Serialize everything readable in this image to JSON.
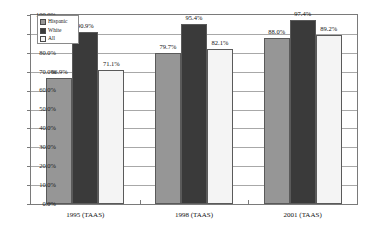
{
  "chart_data": {
    "type": "bar",
    "title": "",
    "xlabel": "",
    "ylabel": "",
    "categories": [
      "1995 (TAAS)",
      "1998 (TAAS)",
      "2001 (TAAS)"
    ],
    "series": [
      {
        "name": "Hispanic",
        "color": "#969696",
        "values": [
          66.9,
          79.7,
          88.0
        ],
        "labels": [
          "66.9%",
          "79.7%",
          "88.0%"
        ]
      },
      {
        "name": "White",
        "color": "#3a3a3a",
        "values": [
          90.9,
          95.4,
          97.4
        ],
        "labels": [
          "90.9%",
          "95.4%",
          "97.4%"
        ]
      },
      {
        "name": "All",
        "color": "#f4f4f4",
        "values": [
          71.1,
          82.1,
          89.2
        ],
        "labels": [
          "71.1%",
          "82.1%",
          "89.2%"
        ]
      }
    ],
    "ylim": [
      0,
      100
    ],
    "ytick_labels": [
      "100.0%",
      "90.0%",
      "80.0%",
      "70.0%",
      "60.0%",
      "50.0%",
      "40.0%",
      "30.0%",
      "20.0%",
      "10.0%",
      "0.0%"
    ],
    "ytick_values": [
      100,
      90,
      80,
      70,
      60,
      50,
      40,
      30,
      20,
      10,
      0
    ],
    "grid": true,
    "legend_position": "top-left",
    "value_labels_shown": true
  },
  "legend": {
    "entries": [
      {
        "label": "Hispanic"
      },
      {
        "label": "White"
      },
      {
        "label": "All"
      }
    ]
  },
  "axis": {
    "y_labels": [
      "100.0%",
      "90.0%",
      "80.0%",
      "70.0%",
      "60.0%",
      "50.0%",
      "40.0%",
      "30.0%",
      "20.0%",
      "10.0%",
      "0.0%"
    ],
    "x_labels": [
      "1995 (TAAS)",
      "1998 (TAAS)",
      "2001 (TAAS)"
    ]
  },
  "title_sliver": ""
}
